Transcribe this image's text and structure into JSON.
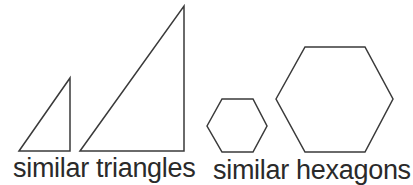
{
  "diagram": {
    "stroke_color": "#3a3a3a",
    "groups": [
      {
        "label": "similar triangles",
        "shapes": [
          {
            "type": "triangle",
            "size": "small",
            "points": [
              [
                19,
                151
              ],
              [
                70,
                78
              ],
              [
                70,
                151
              ]
            ]
          },
          {
            "type": "triangle",
            "size": "large",
            "points": [
              [
                80,
                151
              ],
              [
                184,
                6
              ],
              [
                184,
                151
              ]
            ]
          }
        ]
      },
      {
        "label": "similar hexagons",
        "shapes": [
          {
            "type": "hexagon",
            "size": "small",
            "points": [
              [
                207,
                126
              ],
              [
                222,
                99
              ],
              [
                253,
                99
              ],
              [
                267,
                126
              ],
              [
                253,
                152
              ],
              [
                222,
                152
              ]
            ]
          },
          {
            "type": "hexagon",
            "size": "large",
            "points": [
              [
                276,
                99
              ],
              [
                305,
                47
              ],
              [
                365,
                47
              ],
              [
                393,
                99
              ],
              [
                365,
                152
              ],
              [
                305,
                152
              ]
            ]
          }
        ]
      }
    ]
  }
}
